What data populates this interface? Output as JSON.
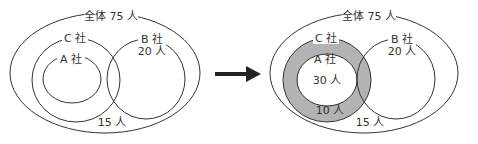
{
  "colors": {
    "stroke": "#333333",
    "shade": "#b3b3b3",
    "background": "#ffffff",
    "arrow": "#222222"
  },
  "left_diagram": {
    "universe_label": "全体 75 人",
    "c_label": "C 社",
    "a_label": "A 社",
    "b_label": "B 社",
    "b_count": "20 人",
    "outside_count": "15 人"
  },
  "right_diagram": {
    "universe_label": "全体 75 人",
    "c_label": "C 社",
    "a_label": "A 社",
    "a_count": "30 人",
    "c_only_count": "10 人",
    "b_label": "B 社",
    "b_count": "20 人",
    "outside_count": "15 人"
  },
  "arrow": {
    "icon": "right-arrow-icon"
  }
}
